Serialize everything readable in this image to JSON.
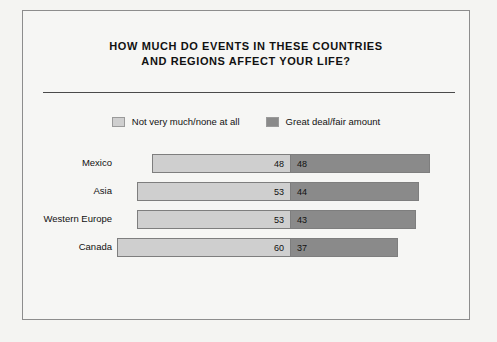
{
  "chart_data": {
    "type": "bar",
    "orientation": "horizontal",
    "stacked": true,
    "title": "HOW MUCH DO EVENTS IN THESE COUNTRIES AND REGIONS AFFECT YOUR LIFE?",
    "title_lines": [
      "HOW MUCH DO EVENTS IN THESE COUNTRIES",
      "AND REGIONS AFFECT YOUR LIFE?"
    ],
    "xlabel": "",
    "ylabel": "",
    "grid": false,
    "legend_position": "top-center",
    "categories": [
      "Mexico",
      "Asia",
      "Western Europe",
      "Canada"
    ],
    "series": [
      {
        "name": "Not very much/none at all",
        "color": "#cfcfcf",
        "values": [
          48,
          53,
          53,
          60
        ]
      },
      {
        "name": "Great deal/fair amount",
        "color": "#8a8a8a",
        "values": [
          48,
          44,
          43,
          37
        ]
      }
    ],
    "rows": [
      {
        "label": "Mexico",
        "left": 48,
        "right": 48
      },
      {
        "label": "Asia",
        "left": 53,
        "right": 44
      },
      {
        "label": "Western Europe",
        "left": 53,
        "right": 43
      },
      {
        "label": "Canada",
        "left": 60,
        "right": 37
      }
    ],
    "junction_note": "bars share a common junction line; left series extends leftward, right series rightward"
  },
  "legend": {
    "items": [
      {
        "label": "Not very much/none at all",
        "color": "#cfcfcf"
      },
      {
        "label": "Great deal/fair amount",
        "color": "#8a8a8a"
      }
    ]
  },
  "layout": {
    "junction_x": 290,
    "unit_px": 2.9,
    "border_color": "#8d8d8d",
    "background": "#f4f4f2"
  }
}
